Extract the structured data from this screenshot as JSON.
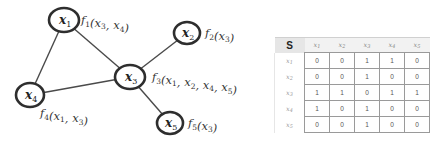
{
  "graph": {
    "nodes": [
      {
        "id": "x1",
        "base": "x",
        "sub": "1",
        "cx": 64,
        "cy": 20,
        "rx": 15,
        "ry": 12
      },
      {
        "id": "x2",
        "base": "x",
        "sub": "2",
        "cx": 187,
        "cy": 33,
        "rx": 13,
        "ry": 11
      },
      {
        "id": "x3",
        "base": "x",
        "sub": "3",
        "cx": 130,
        "cy": 77,
        "rx": 15,
        "ry": 12
      },
      {
        "id": "x4",
        "base": "x",
        "sub": "4",
        "cx": 30,
        "cy": 95,
        "rx": 14,
        "ry": 12
      },
      {
        "id": "x5",
        "base": "x",
        "sub": "5",
        "cx": 170,
        "cy": 123,
        "rx": 13,
        "ry": 11
      }
    ],
    "edges": [
      [
        "x1",
        "x3"
      ],
      [
        "x1",
        "x4"
      ],
      [
        "x2",
        "x3"
      ],
      [
        "x3",
        "x4"
      ],
      [
        "x3",
        "x5"
      ]
    ],
    "factors": [
      {
        "node": "x1",
        "text": "f1(x3, x4)",
        "fn_sub": "1",
        "args": [
          {
            "b": "x",
            "s": "3"
          },
          {
            "b": "x",
            "s": "4"
          }
        ],
        "x": 81,
        "y": 24
      },
      {
        "node": "x2",
        "text": "f2(x3)",
        "fn_sub": "2",
        "args": [
          {
            "b": "x",
            "s": "3"
          }
        ],
        "x": 205,
        "y": 37
      },
      {
        "node": "x3",
        "text": "f3(x1, x2, x4, x5)",
        "fn_sub": "3",
        "args": [
          {
            "b": "x",
            "s": "1"
          },
          {
            "b": "x",
            "s": "2"
          },
          {
            "b": "x",
            "s": "4"
          },
          {
            "b": "x",
            "s": "5"
          }
        ],
        "x": 152,
        "y": 81
      },
      {
        "node": "x4",
        "text": "f4(x1, x3)",
        "fn_sub": "4",
        "args": [
          {
            "b": "x",
            "s": "1"
          },
          {
            "b": "x",
            "s": "3"
          }
        ],
        "x": 40,
        "y": 117
      },
      {
        "node": "x5",
        "text": "f5(x3)",
        "fn_sub": "5",
        "args": [
          {
            "b": "x",
            "s": "3"
          }
        ],
        "x": 188,
        "y": 127
      }
    ]
  },
  "table": {
    "corner_label": "S",
    "column_headers": [
      {
        "base": "x",
        "sub": "1"
      },
      {
        "base": "x",
        "sub": "2"
      },
      {
        "base": "x",
        "sub": "3"
      },
      {
        "base": "x",
        "sub": "4"
      },
      {
        "base": "x",
        "sub": "5"
      }
    ],
    "rows": [
      {
        "header": {
          "base": "x",
          "sub": "1"
        },
        "values": [
          "0",
          "0",
          "1",
          "1",
          "0"
        ]
      },
      {
        "header": {
          "base": "x",
          "sub": "2"
        },
        "values": [
          "0",
          "0",
          "1",
          "0",
          "0"
        ]
      },
      {
        "header": {
          "base": "x",
          "sub": "3"
        },
        "values": [
          "1",
          "1",
          "0",
          "1",
          "1"
        ]
      },
      {
        "header": {
          "base": "x",
          "sub": "4"
        },
        "values": [
          "1",
          "0",
          "1",
          "0",
          "0"
        ]
      },
      {
        "header": {
          "base": "x",
          "sub": "5"
        },
        "values": [
          "0",
          "0",
          "1",
          "0",
          "0"
        ]
      }
    ]
  }
}
